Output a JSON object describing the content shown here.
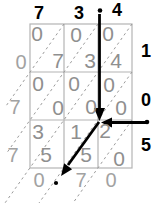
{
  "figure_type": "lattice multiplication grid",
  "lattice": {
    "top_digits": [
      "7",
      "3",
      "4"
    ],
    "right_digits": [
      "1",
      "0",
      "5"
    ],
    "left_result_digits": [
      "0",
      "7",
      "7"
    ],
    "bottom_result_digits": [
      "0",
      "7",
      "0"
    ],
    "rows": [
      {
        "cells": [
          {
            "tens": "0",
            "units": "7"
          },
          {
            "tens": "0",
            "units": "3"
          },
          {
            "tens": "0",
            "units": "4"
          }
        ]
      },
      {
        "cells": [
          {
            "tens": "0",
            "units": "0"
          },
          {
            "tens": "0",
            "units": "0"
          },
          {
            "tens": "0",
            "units": "0"
          }
        ]
      },
      {
        "cells": [
          {
            "tens": "3",
            "units": "5"
          },
          {
            "tens": "1",
            "units": "5"
          },
          {
            "tens": "2",
            "units": "0"
          }
        ]
      }
    ]
  },
  "colors": {
    "background": "#ffffff",
    "operand_digits": "#000000",
    "cell_digits": "#8f8f8f",
    "result_digits": "#a2a2a2",
    "grid_lines": "#b4b4b4",
    "dashed_diagonals": "#9a9a9a",
    "arrows_and_dots": "#000000"
  }
}
